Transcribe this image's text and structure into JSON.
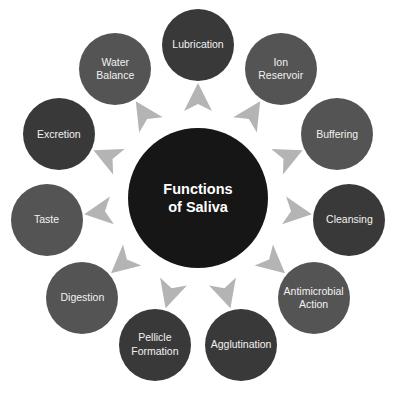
{
  "diagram": {
    "title": "Functions of Saliva",
    "center": {
      "lines": [
        "Functions",
        "of Saliva"
      ],
      "x": 198,
      "y": 198,
      "r": 70,
      "color": "#161616"
    },
    "ring_radius": 153,
    "arrow_radius": 98,
    "node_radius": 36,
    "arrow_color": "#b4b4b4",
    "colors": {
      "dark": "#393939",
      "medium": "#545454"
    },
    "nodes": [
      {
        "lines": [
          "Lubrication"
        ],
        "tone": "dark"
      },
      {
        "lines": [
          "Ion",
          "Reservoir"
        ],
        "tone": "medium"
      },
      {
        "lines": [
          "Buffering"
        ],
        "tone": "medium"
      },
      {
        "lines": [
          "Cleansing"
        ],
        "tone": "dark"
      },
      {
        "lines": [
          "Antimicrobial",
          "Action"
        ],
        "tone": "medium"
      },
      {
        "lines": [
          "Agglutination"
        ],
        "tone": "dark"
      },
      {
        "lines": [
          "Pellicle",
          "Formation"
        ],
        "tone": "dark"
      },
      {
        "lines": [
          "Digestion"
        ],
        "tone": "medium"
      },
      {
        "lines": [
          "Taste"
        ],
        "tone": "medium"
      },
      {
        "lines": [
          "Excretion"
        ],
        "tone": "dark"
      },
      {
        "lines": [
          "Water",
          "Balance"
        ],
        "tone": "medium"
      }
    ]
  }
}
